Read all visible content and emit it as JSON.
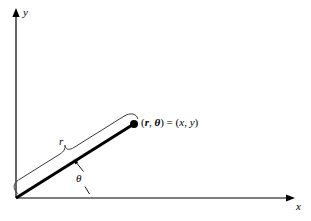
{
  "figure": {
    "background_color": "#ffffff",
    "ink_color": "#000000",
    "brace_color": "#3a3a3a"
  },
  "axes": {
    "y_axis_label": "y",
    "x_axis_label": "x",
    "origin": {
      "x": 16,
      "y": 198
    },
    "y_axis_tip": {
      "x": 16,
      "y": 10
    },
    "x_axis_tip": {
      "x": 293,
      "y": 198
    }
  },
  "ray": {
    "start": {
      "x": 16,
      "y": 198
    },
    "end": {
      "x": 134,
      "y": 124
    },
    "stroke_width": 3
  },
  "point": {
    "marker": "filled-dot",
    "position": {
      "x": 134,
      "y": 124
    },
    "radius": 4,
    "label_parts": {
      "open_polar": "(",
      "r": "r",
      "comma_polar": ", ",
      "theta": "θ",
      "close_polar": ")",
      "equals": " = ",
      "open_cartesian": "(",
      "x": "x",
      "comma_cartesian": ", ",
      "y": "y",
      "close_cartesian": ")"
    },
    "label_text": "(r, θ) = (x, y)"
  },
  "brace": {
    "label": "r",
    "description": "curly brace spanning the ray, tip pointing up at midpoint"
  },
  "angle": {
    "label": "θ",
    "description": "angle between positive x-axis and the ray"
  }
}
